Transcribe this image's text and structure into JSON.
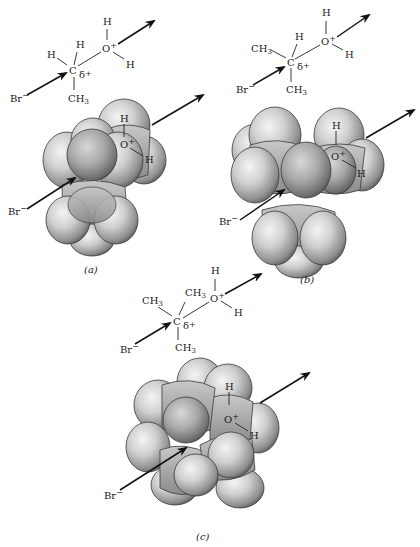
{
  "figure": {
    "panels": [
      {
        "id": "a",
        "caption": "(a)",
        "structure": {
          "center": "C",
          "partial_charge": "δ+",
          "substituents": [
            "H",
            "H",
            "CH3"
          ],
          "leaving_group": {
            "atom": "O+",
            "h_labels": [
              "H",
              "H"
            ]
          },
          "nucleophile": "Br−"
        },
        "model_labels": {
          "h_top": "H",
          "oxygen": "O+",
          "h_side": "H",
          "nucleophile": "Br−"
        }
      },
      {
        "id": "b",
        "caption": "(b)",
        "structure": {
          "center": "C",
          "partial_charge": "δ+",
          "substituents": [
            "CH3",
            "H",
            "CH3"
          ],
          "leaving_group": {
            "atom": "O+",
            "h_labels": [
              "H",
              "H"
            ]
          },
          "nucleophile": "Br−"
        },
        "model_labels": {
          "h_top": "H",
          "oxygen": "O+",
          "h_side": "H",
          "nucleophile": "Br−"
        }
      },
      {
        "id": "c",
        "caption": "(c)",
        "structure": {
          "center": "C",
          "partial_charge": "δ+",
          "substituents": [
            "CH3",
            "CH3",
            "CH3"
          ],
          "leaving_group": {
            "atom": "O+",
            "h_labels": [
              "H",
              "H"
            ]
          },
          "nucleophile": "Br−"
        },
        "model_labels": {
          "h_top": "H",
          "oxygen": "O+",
          "h_side": "H",
          "nucleophile": "Br−"
        }
      }
    ],
    "text": {
      "C": "C",
      "H": "H",
      "CH": "CH",
      "three": "3",
      "O": "O",
      "plus": "+",
      "Br": "Br",
      "minus": "−",
      "delta": "δ",
      "cap_a": "(a)",
      "cap_b": "(b)",
      "cap_c": "(c)"
    }
  }
}
